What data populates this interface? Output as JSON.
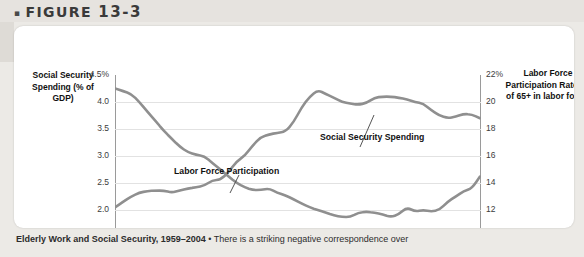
{
  "figure": {
    "bullet": "▪",
    "label": "FIGURE",
    "number": "13-3"
  },
  "axes": {
    "y_left_title": "Social Security Spending (% of GDP)",
    "y_right_title": "Labor Force Participation Rate (% of 65+ in labor force)",
    "y_left_ticks": [
      "4.5%",
      "4.0",
      "3.5",
      "3.0",
      "2.5",
      "2.0",
      "1.5"
    ],
    "y_right_ticks": [
      "22%",
      "20",
      "18",
      "16",
      "14",
      "12",
      "10"
    ],
    "x_ticks": [
      "1959",
      "1965",
      "1971",
      "1977",
      "1983",
      "1989",
      "1995",
      "2001",
      "2004"
    ]
  },
  "series_labels": {
    "social_security": "Social Security Spending",
    "labor_force": "Labor Force Participation"
  },
  "caption": {
    "title": "Elderly Work and Social Security, 1959–2004",
    "separator": " • ",
    "text": "There is a striking negative correspondence over"
  },
  "colors": {
    "line": "#8f8f8f",
    "grid": "#e2e2e2",
    "axis": "#9a9a9a",
    "card": "#ffffff",
    "page_background": "#eceae6"
  },
  "chart_data": {
    "type": "line",
    "title": "Elderly Work and Social Security, 1959–2004",
    "xlabel": "",
    "ylabel": "Social Security Spending (% of GDP)",
    "y2label": "Labor Force Participation Rate (% of 65+ in labor force)",
    "xlim": [
      1959,
      2004
    ],
    "ylim": [
      1.5,
      4.5
    ],
    "y2lim": [
      10,
      22
    ],
    "grid": true,
    "legend": "annotations-on-plot",
    "x": [
      1959,
      1960,
      1961,
      1962,
      1963,
      1964,
      1965,
      1966,
      1967,
      1968,
      1969,
      1970,
      1971,
      1972,
      1973,
      1974,
      1975,
      1976,
      1977,
      1978,
      1979,
      1980,
      1981,
      1982,
      1983,
      1984,
      1985,
      1986,
      1987,
      1988,
      1989,
      1990,
      1991,
      1992,
      1993,
      1994,
      1995,
      1996,
      1997,
      1998,
      1999,
      2000,
      2001,
      2002,
      2003,
      2004
    ],
    "series": [
      {
        "name": "Labor Force Participation",
        "axis": "right",
        "units": "% of 65+ in labor force",
        "values": [
          21.0,
          20.8,
          20.6,
          20.0,
          19.3,
          18.6,
          17.9,
          17.3,
          16.7,
          16.3,
          16.1,
          16.0,
          15.5,
          15.0,
          14.5,
          14.0,
          13.7,
          13.5,
          13.5,
          13.6,
          13.3,
          13.1,
          12.8,
          12.5,
          12.2,
          12.0,
          11.8,
          11.6,
          11.5,
          11.5,
          11.8,
          11.9,
          11.8,
          11.7,
          11.5,
          11.7,
          12.2,
          11.9,
          12.0,
          11.9,
          12.0,
          12.6,
          13.0,
          13.4,
          13.6,
          14.5
        ],
        "left_axis_equivalent": [
          4.25,
          4.2,
          4.15,
          4.0,
          3.82,
          3.65,
          3.47,
          3.32,
          3.17,
          3.07,
          3.02,
          3.0,
          2.87,
          2.75,
          2.62,
          2.5,
          2.42,
          2.37,
          2.37,
          2.4,
          2.32,
          2.27,
          2.2,
          2.12,
          2.05,
          2.0,
          1.95,
          1.9,
          1.87,
          1.87,
          1.95,
          1.97,
          1.95,
          1.92,
          1.87,
          1.92,
          2.05,
          1.97,
          2.0,
          1.97,
          2.0,
          2.15,
          2.25,
          2.35,
          2.4,
          2.62
        ]
      },
      {
        "name": "Social Security Spending",
        "axis": "left",
        "units": "% of GDP",
        "values": [
          2.05,
          2.15,
          2.25,
          2.32,
          2.35,
          2.36,
          2.36,
          2.32,
          2.36,
          2.4,
          2.42,
          2.45,
          2.55,
          2.56,
          2.7,
          2.9,
          3.0,
          3.2,
          3.35,
          3.4,
          3.43,
          3.45,
          3.62,
          3.9,
          4.1,
          4.22,
          4.15,
          4.08,
          4.0,
          3.97,
          3.95,
          3.98,
          4.08,
          4.1,
          4.1,
          4.08,
          4.05,
          4.0,
          3.97,
          3.85,
          3.75,
          3.7,
          3.73,
          3.78,
          3.77,
          3.7
        ],
        "right_axis_equivalent": [
          12.2,
          12.6,
          13.0,
          13.3,
          13.4,
          13.4,
          13.4,
          13.3,
          13.4,
          13.6,
          13.7,
          13.8,
          14.2,
          14.2,
          14.8,
          15.6,
          16.0,
          16.8,
          17.4,
          17.6,
          17.7,
          17.8,
          18.5,
          19.6,
          20.4,
          20.9,
          20.6,
          20.3,
          20.0,
          19.9,
          19.8,
          19.9,
          20.3,
          20.4,
          20.4,
          20.3,
          20.2,
          20.0,
          19.9,
          19.4,
          19.0,
          18.8,
          18.9,
          19.1,
          19.1,
          18.8
        ]
      }
    ]
  }
}
